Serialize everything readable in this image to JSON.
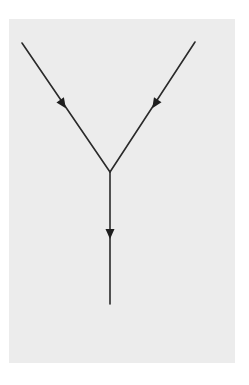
{
  "diagram": {
    "type": "vertex",
    "background": "#ececec",
    "line_color": "#2a2a2a",
    "vertex": {
      "x": 110,
      "y": 172
    },
    "lines": [
      {
        "name": "incoming-left",
        "from": {
          "x": 22,
          "y": 43
        },
        "to": {
          "x": 110,
          "y": 172
        },
        "arrow": {
          "x": 63,
          "y": 104,
          "direction": "down-right"
        }
      },
      {
        "name": "incoming-right",
        "from": {
          "x": 195,
          "y": 42
        },
        "to": {
          "x": 110,
          "y": 172
        },
        "arrow": {
          "x": 155,
          "y": 104,
          "direction": "down-left"
        }
      },
      {
        "name": "outgoing-down",
        "from": {
          "x": 110,
          "y": 172
        },
        "to": {
          "x": 110,
          "y": 304
        },
        "arrow": {
          "x": 110,
          "y": 234,
          "direction": "down"
        }
      }
    ]
  }
}
